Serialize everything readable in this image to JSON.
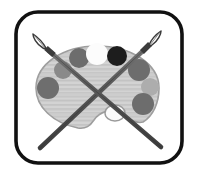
{
  "image": {
    "title": "Artist Palette with Crossed Paintbrushes",
    "alt_text": "Grayscale icon of a painter's palette with paint wells and two crossed paintbrushes inside a rounded square frame",
    "width": 197,
    "height": 176,
    "background_color": "#ffffff",
    "style": "grayscale line art icon"
  },
  "frame": {
    "name": "rounded-square-border",
    "stroke_color": "#111111",
    "fill_color": "#ffffff",
    "stroke_width": 4,
    "corner_radius": 22,
    "x": 14,
    "y": 10,
    "width": 170,
    "height": 155
  },
  "palette": {
    "name": "artist-palette",
    "fill_color": "#d0d0d0",
    "stroke_color": "#9a9a9a",
    "texture": "horizontal hatch lines",
    "texture_color": "#c2c2c2",
    "center_x": 97,
    "center_y": 88,
    "radius_x": 62,
    "radius_y": 42,
    "thumb_hole": {
      "name": "thumb-hole",
      "fill_color": "#fbfbfb",
      "stroke_color": "#9a9a9a",
      "center_x": 115,
      "center_y": 113,
      "radius_x": 10,
      "radius_y": 8
    },
    "notch": {
      "name": "palette-bottom-notch",
      "description": "concave scoop on lower edge of palette"
    }
  },
  "paint_wells": [
    {
      "id": "well-1",
      "label": "dark gray paint well left",
      "color": "#6e6e6e",
      "cx": 48,
      "cy": 88,
      "r": 11
    },
    {
      "id": "well-2",
      "label": "gray paint well upper left",
      "color": "#8a8a8a",
      "cx": 63,
      "cy": 70,
      "r": 9
    },
    {
      "id": "well-3",
      "label": "dark gray paint well top left",
      "color": "#6d6d6d",
      "cx": 79,
      "cy": 58,
      "r": 10
    },
    {
      "id": "well-4",
      "label": "white paint well top center",
      "color": "#fcfcfc",
      "cx": 97,
      "cy": 54,
      "r": 11
    },
    {
      "id": "well-5",
      "label": "black paint well top right",
      "color": "#1d1d1d",
      "cx": 117,
      "cy": 56,
      "r": 10
    },
    {
      "id": "well-6",
      "label": "dark gray paint well right",
      "color": "#6d6d6d",
      "cx": 139,
      "cy": 70,
      "r": 11
    },
    {
      "id": "well-7",
      "label": "light gray paint well right",
      "color": "#adadad",
      "cx": 150,
      "cy": 87,
      "r": 9
    },
    {
      "id": "well-8",
      "label": "dark gray paint well lower right",
      "color": "#6d6d6d",
      "cx": 143,
      "cy": 104,
      "r": 11
    }
  ],
  "brushes": [
    {
      "id": "brush-left",
      "label": "paintbrush pointing upper-left",
      "handle_color": "#5d5d5d",
      "handle_edge_color": "#3a3a3a",
      "ferrule_color": "#4a4a4a",
      "bristle_fill": "#ffffff",
      "bristle_stroke": "#3a3a3a",
      "tip_x": 37,
      "tip_y": 41,
      "end_x": 160,
      "end_y": 146
    },
    {
      "id": "brush-right",
      "label": "paintbrush pointing upper-right",
      "handle_color": "#5d5d5d",
      "handle_edge_color": "#3a3a3a",
      "ferrule_color": "#4a4a4a",
      "bristle_fill": "#ffffff",
      "bristle_stroke": "#3a3a3a",
      "tip_x": 158,
      "tip_y": 38,
      "end_x": 40,
      "end_y": 148
    }
  ],
  "colors": {
    "ink": "#111111",
    "palette_body": "#d0d0d0",
    "white": "#ffffff",
    "black_paint": "#1d1d1d",
    "mid_gray": "#6d6d6d",
    "light_gray": "#adadad"
  }
}
